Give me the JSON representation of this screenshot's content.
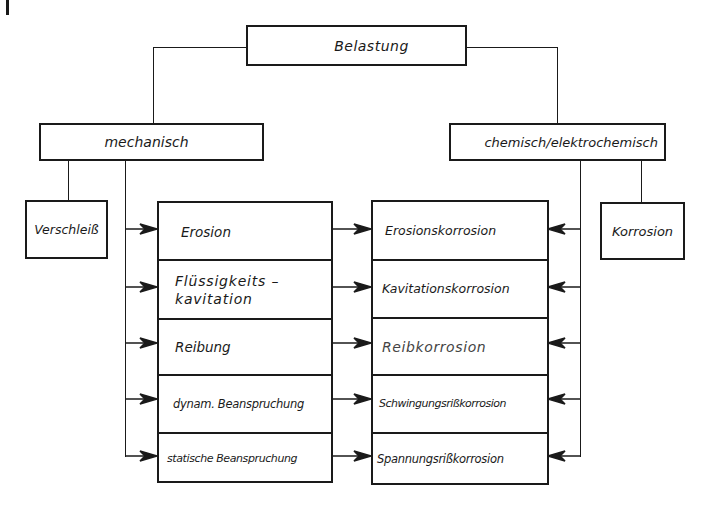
{
  "diagram": {
    "root": {
      "label": "Belastung"
    },
    "categories": {
      "mechanical": {
        "label": "mechanisch"
      },
      "chemical": {
        "label": "chemisch/elektrochemisch"
      }
    },
    "side_boxes": {
      "left": {
        "label": "Verschleiß"
      },
      "right": {
        "label": "Korrosion"
      }
    },
    "mechanical_types": [
      {
        "label": "Erosion"
      },
      {
        "label": "Flüssigkeits –",
        "label2": "kavitation"
      },
      {
        "label": "Reibung"
      },
      {
        "label": "dynam. Beanspruchung"
      },
      {
        "label": "statische Beanspruchung"
      }
    ],
    "corrosion_types": [
      {
        "label": "Erosionskorrosion"
      },
      {
        "label": "Kavitationskorrosion"
      },
      {
        "label": "Reibkorrosion"
      },
      {
        "label": "Schwingungsrißkorrosion"
      },
      {
        "label": "Spannungsrißkorrosion"
      }
    ],
    "colors": {
      "line": "#1a1a1a",
      "background": "#ffffff"
    }
  }
}
